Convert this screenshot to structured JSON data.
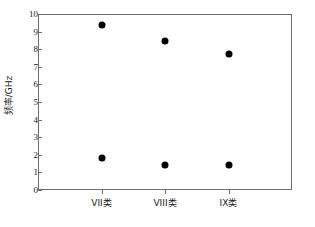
{
  "chart_data": {
    "type": "scatter",
    "title": "",
    "xlabel": "",
    "ylabel": "频率/GHz",
    "categories": [
      "VII类",
      "VIII类",
      "IX类"
    ],
    "ylim": [
      0,
      10
    ],
    "yticks": [
      0,
      1,
      2,
      3,
      4,
      5,
      6,
      7,
      8,
      9,
      10
    ],
    "ytick_labels": [
      "0",
      "1",
      "2",
      "3",
      "4",
      "5",
      "6",
      "7",
      "8",
      "9",
      "10"
    ],
    "grid": false,
    "legend": "none",
    "marker": "filled-circle",
    "marker_color": "#000000",
    "series": [
      {
        "name": "高频点",
        "values": [
          9.4,
          8.45,
          7.7
        ]
      },
      {
        "name": "低频点",
        "values": [
          1.8,
          1.4,
          1.42
        ]
      }
    ],
    "points": [
      {
        "category": "VII类",
        "value": 9.4
      },
      {
        "category": "VII类",
        "value": 1.8
      },
      {
        "category": "VIII类",
        "value": 8.45
      },
      {
        "category": "VIII类",
        "value": 1.4
      },
      {
        "category": "IX类",
        "value": 7.7
      },
      {
        "category": "IX类",
        "value": 1.42
      }
    ]
  },
  "figure": {
    "background_color": "#ffffff",
    "frame_color": "#6e6e6e",
    "text_color": "#1a1a1a"
  }
}
